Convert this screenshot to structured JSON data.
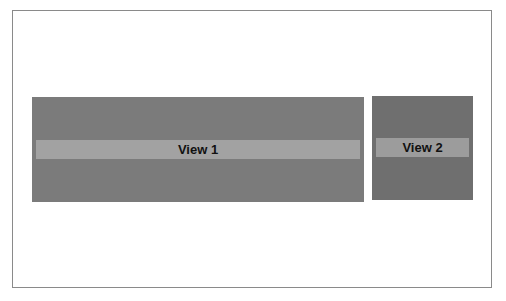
{
  "diagram": {
    "views": [
      {
        "label": "View 1"
      },
      {
        "label": "View 2"
      }
    ],
    "colors": {
      "frame_border": "#8a8a8a",
      "view1_bg": "#7b7b7b",
      "view2_bg": "#6f6f6f",
      "label_bar": "#a2a2a2"
    }
  }
}
